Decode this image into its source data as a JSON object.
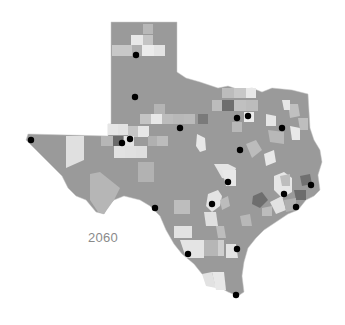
{
  "map": {
    "title_label": "2060",
    "colors": {
      "base": "#9a9a9a",
      "light": "#dcdcdc",
      "lighter": "#ececec",
      "mid": "#b8b8b8",
      "dark": "#6e6e6e",
      "border": "#c8c8c8",
      "city_dot": "#000000"
    },
    "city_markers": [
      {
        "x": 136,
        "y": 55
      },
      {
        "x": 135,
        "y": 97
      },
      {
        "x": 180,
        "y": 128
      },
      {
        "x": 237,
        "y": 118
      },
      {
        "x": 248,
        "y": 116
      },
      {
        "x": 282,
        "y": 128
      },
      {
        "x": 130,
        "y": 139
      },
      {
        "x": 122,
        "y": 143
      },
      {
        "x": 31,
        "y": 140
      },
      {
        "x": 240,
        "y": 150
      },
      {
        "x": 228,
        "y": 182
      },
      {
        "x": 311,
        "y": 185
      },
      {
        "x": 284,
        "y": 194
      },
      {
        "x": 212,
        "y": 204
      },
      {
        "x": 155,
        "y": 208
      },
      {
        "x": 296,
        "y": 207
      },
      {
        "x": 237,
        "y": 249
      },
      {
        "x": 188,
        "y": 254
      },
      {
        "x": 236,
        "y": 295
      }
    ]
  }
}
